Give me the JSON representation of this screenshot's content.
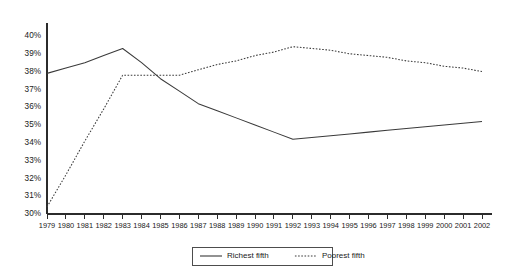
{
  "chart_data": {
    "type": "line",
    "title": "",
    "subtitle": "",
    "xlabel": "",
    "ylabel": "",
    "grid": false,
    "legend_position": "bottom",
    "x": [
      1979,
      1980,
      1981,
      1982,
      1983,
      1984,
      1985,
      1986,
      1987,
      1988,
      1989,
      1990,
      1991,
      1992,
      1993,
      1994,
      1995,
      1996,
      1997,
      1998,
      1999,
      2000,
      2001,
      2002
    ],
    "categories": [
      "1979",
      "1980",
      "1981",
      "1982",
      "1983",
      "1984",
      "1985",
      "1986",
      "1987",
      "1988",
      "1989",
      "1990",
      "1991",
      "1992",
      "1993",
      "1994",
      "1995",
      "1996",
      "1997",
      "1998",
      "1999",
      "2000",
      "2001",
      "2002"
    ],
    "xlim": [
      1979,
      2002
    ],
    "ylim": [
      30,
      40
    ],
    "ytick_labels": [
      "40%",
      "39%",
      "38%",
      "37%",
      "36%",
      "35%",
      "34%",
      "33%",
      "32%",
      "31%",
      "30%"
    ],
    "ytick_values": [
      40,
      39,
      38,
      37,
      36,
      35,
      34,
      33,
      32,
      31,
      30
    ],
    "series": [
      {
        "name": "Richest fifth",
        "style": "solid",
        "color": "#3a3a3a",
        "values": [
          37.9,
          38.2,
          38.5,
          38.9,
          39.3,
          38.5,
          37.6,
          36.9,
          36.2,
          35.8,
          35.4,
          35.0,
          34.6,
          34.2,
          34.3,
          34.4,
          34.5,
          34.6,
          34.7,
          34.8,
          34.9,
          35.0,
          35.1,
          35.2
        ]
      },
      {
        "name": "Poorest fifth",
        "style": "dotted",
        "color": "#3a3a3a",
        "values": [
          30.4,
          32.2,
          34.1,
          35.9,
          37.8,
          37.8,
          37.8,
          37.8,
          38.1,
          38.4,
          38.6,
          38.9,
          39.1,
          39.4,
          39.3,
          39.2,
          39.0,
          38.9,
          38.8,
          38.6,
          38.5,
          38.3,
          38.2,
          38.0
        ]
      }
    ]
  },
  "legend": {
    "entries": [
      {
        "label": "Richest fifth",
        "style": "solid"
      },
      {
        "label": "Poorest fifth",
        "style": "dotted"
      }
    ]
  }
}
